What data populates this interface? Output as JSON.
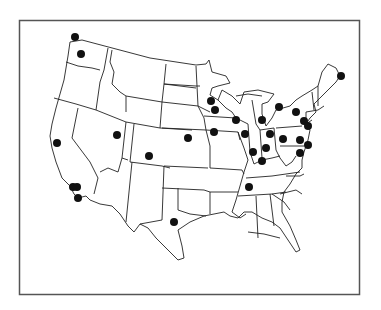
{
  "map": {
    "title": "",
    "region": "Contiguous United States",
    "frame": {
      "x": 19,
      "y": 20,
      "width": 341,
      "height": 275,
      "stroke": "#555555"
    },
    "outline_color": "#222222",
    "marker_color": "#111111",
    "marker_radius": 4,
    "markers": [
      {
        "id": "wa-1",
        "x": 75,
        "y": 37
      },
      {
        "id": "wa-2",
        "x": 81,
        "y": 54
      },
      {
        "id": "ca-1",
        "x": 57,
        "y": 143
      },
      {
        "id": "ca-2",
        "x": 73,
        "y": 187
      },
      {
        "id": "ca-3",
        "x": 77,
        "y": 187
      },
      {
        "id": "ca-4",
        "x": 78,
        "y": 198
      },
      {
        "id": "ut-1",
        "x": 117,
        "y": 135
      },
      {
        "id": "co-1",
        "x": 149,
        "y": 156
      },
      {
        "id": "ks-1",
        "x": 188,
        "y": 138
      },
      {
        "id": "tx-1",
        "x": 174,
        "y": 222
      },
      {
        "id": "mn-1",
        "x": 211,
        "y": 101
      },
      {
        "id": "mn-2",
        "x": 215,
        "y": 110
      },
      {
        "id": "ia-1",
        "x": 214,
        "y": 132
      },
      {
        "id": "wi-1",
        "x": 236,
        "y": 120
      },
      {
        "id": "il-1",
        "x": 245,
        "y": 134
      },
      {
        "id": "mi-1",
        "x": 262,
        "y": 120
      },
      {
        "id": "ny-w-1",
        "x": 279,
        "y": 107
      },
      {
        "id": "ny-1",
        "x": 296,
        "y": 112
      },
      {
        "id": "oh-1",
        "x": 270,
        "y": 134
      },
      {
        "id": "in-1",
        "x": 253,
        "y": 152
      },
      {
        "id": "oh-2",
        "x": 266,
        "y": 148
      },
      {
        "id": "ky-1",
        "x": 262,
        "y": 161
      },
      {
        "id": "pa-1",
        "x": 283,
        "y": 139
      },
      {
        "id": "pa-2",
        "x": 300,
        "y": 140
      },
      {
        "id": "ny-2",
        "x": 304,
        "y": 121
      },
      {
        "id": "nj-1",
        "x": 308,
        "y": 126
      },
      {
        "id": "nj-2",
        "x": 308,
        "y": 145
      },
      {
        "id": "md-1",
        "x": 300,
        "y": 153
      },
      {
        "id": "tn-1",
        "x": 249,
        "y": 187
      },
      {
        "id": "me-1",
        "x": 341,
        "y": 76
      }
    ]
  }
}
